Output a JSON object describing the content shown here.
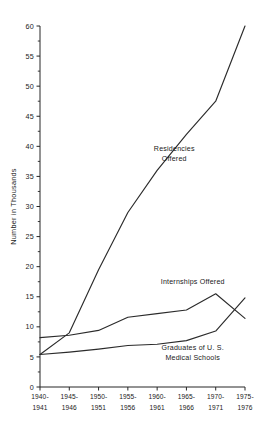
{
  "chart_data": {
    "type": "line",
    "title": "",
    "xlabel": "",
    "ylabel": "Number in Thousands",
    "ylim": [
      0,
      60
    ],
    "ytick_step": 5,
    "yminor_step": 2.5,
    "grid": false,
    "legend_position": "inline-annotations",
    "categories": [
      "1940-\n1941",
      "1945-\n1946",
      "1950-\n1951",
      "1955-\n1956",
      "1960-\n1961",
      "1965-\n1966",
      "1970-\n1971",
      "1975-\n1976"
    ],
    "category_lines": [
      [
        "1940-",
        "1941"
      ],
      [
        "1945-",
        "1946"
      ],
      [
        "1950-",
        "1951"
      ],
      [
        "1955-",
        "1956"
      ],
      [
        "1960-",
        "1961"
      ],
      [
        "1965-",
        "1966"
      ],
      [
        "1970-",
        "1971"
      ],
      [
        "1975-",
        "1976"
      ]
    ],
    "ytick_labels": [
      "0",
      "5",
      "10",
      "15",
      "20",
      "25",
      "30",
      "35",
      "40",
      "45",
      "50",
      "55",
      "60"
    ],
    "ytick_values": [
      0,
      5,
      10,
      15,
      20,
      25,
      30,
      35,
      40,
      45,
      50,
      55,
      60
    ],
    "series": [
      {
        "name": "Residencies Offered",
        "label_lines": [
          "Residencies",
          "Offered"
        ],
        "values": [
          5.4,
          9.0,
          19.5,
          29.0,
          36.0,
          42.0,
          47.5,
          60.0
        ]
      },
      {
        "name": "Internships Offered",
        "label_lines": [
          "Internships Offered"
        ],
        "values": [
          8.2,
          8.6,
          9.4,
          11.6,
          12.2,
          12.8,
          15.5,
          11.4
        ]
      },
      {
        "name": "Graduates of U. S. Medical Schools",
        "label_lines": [
          "Graduates of U. S.",
          "Medical Schools"
        ],
        "values": [
          5.4,
          5.8,
          6.3,
          6.9,
          7.1,
          7.7,
          9.3,
          14.8
        ]
      }
    ],
    "annotations": [
      {
        "id": "residencies",
        "text_lines": [
          "Residencies",
          "Offered"
        ],
        "x": 0.655,
        "y": 39.2
      },
      {
        "id": "internships",
        "text_lines": [
          "Internships Offered"
        ],
        "x": 0.745,
        "y": 17.1
      },
      {
        "id": "graduates",
        "text_lines": [
          "Graduates of U. S.",
          "Medical Schools"
        ],
        "x": 0.745,
        "y": 6.1
      }
    ],
    "colors": {
      "line": "#2b2b2b",
      "axis": "#262626",
      "text": "#1a1a1a",
      "background": "#ffffff"
    }
  }
}
